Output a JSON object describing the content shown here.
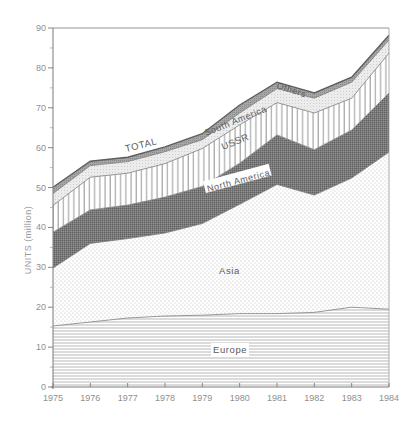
{
  "chart_data": {
    "type": "area",
    "stacked": true,
    "title": "",
    "xlabel": "",
    "ylabel": "UNITS (million)",
    "x": [
      1975,
      1976,
      1977,
      1978,
      1979,
      1980,
      1981,
      1982,
      1983,
      1984
    ],
    "xlim": [
      1975,
      1984
    ],
    "ylim": [
      0,
      90
    ],
    "yticks": [
      0,
      10,
      20,
      30,
      40,
      50,
      60,
      70,
      80,
      90
    ],
    "grid": false,
    "legend": "inline labels",
    "series": [
      {
        "name": "Europe",
        "pattern": "horizontal-lines",
        "values": [
          15.3,
          16.3,
          17.3,
          17.8,
          18.0,
          18.4,
          18.4,
          18.7,
          20.0,
          19.5
        ]
      },
      {
        "name": "Asia",
        "pattern": "dots",
        "values": [
          14.5,
          19.7,
          19.9,
          20.8,
          23.0,
          27.4,
          32.4,
          29.4,
          32.4,
          39.4
        ]
      },
      {
        "name": "North America",
        "pattern": "dense-dark",
        "values": [
          9.0,
          8.4,
          8.4,
          9.0,
          9.3,
          10.3,
          12.4,
          11.4,
          12.0,
          14.8
        ]
      },
      {
        "name": "USSR",
        "pattern": "vertical-lines",
        "values": [
          6.7,
          8.2,
          8.0,
          8.4,
          9.5,
          9.6,
          8.1,
          9.2,
          8.0,
          10.0
        ]
      },
      {
        "name": "South America",
        "pattern": "light-dots",
        "values": [
          3.0,
          2.9,
          2.9,
          3.0,
          2.2,
          3.0,
          3.5,
          3.7,
          4.0,
          3.3
        ]
      },
      {
        "name": "Others",
        "pattern": "gray",
        "values": [
          1.6,
          1.1,
          1.1,
          1.2,
          1.5,
          2.0,
          1.6,
          1.3,
          1.3,
          1.2
        ]
      }
    ],
    "total": {
      "name": "TOTAL",
      "values": [
        50.1,
        56.6,
        57.6,
        60.2,
        63.5,
        70.7,
        76.4,
        73.7,
        77.7,
        88.2
      ]
    },
    "annotations": [
      "TOTAL",
      "Others",
      "South America",
      "USSR",
      "North America",
      "Asia",
      "Europe"
    ]
  },
  "axes": {
    "ylabel": "UNITS (million)",
    "y_tick_labels": [
      "0",
      "10",
      "20",
      "30",
      "40",
      "50",
      "60",
      "70",
      "80",
      "90"
    ],
    "x_tick_labels": [
      "1975",
      "1976",
      "1977",
      "1978",
      "1979",
      "1980",
      "1981",
      "1982",
      "1983",
      "1984"
    ]
  },
  "labels": {
    "total": "TOTAL",
    "others": "Others",
    "south_america": "South America",
    "ussr": "USSR",
    "north_america": "North America",
    "asia": "Asia",
    "europe": "Europe"
  },
  "colors": {
    "axis": "#7a7a7a",
    "europe_line": "#9a9a9a",
    "asia_dot": "#a8a8a8",
    "north_america_fill": "#6e6e6e",
    "ussr_line": "#8c8c8c",
    "south_america_fill": "#e6e6e6",
    "others_fill": "#9d9d9d",
    "total_line": "#6a6a6a"
  }
}
